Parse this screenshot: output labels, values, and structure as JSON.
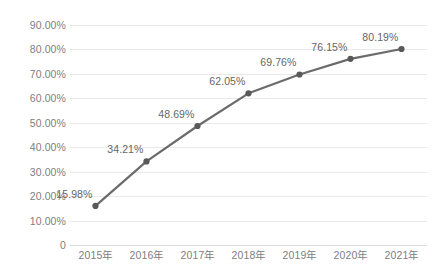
{
  "chart_data": {
    "type": "line",
    "title": "",
    "xlabel": "",
    "ylabel": "",
    "categories": [
      "2015年",
      "2016年",
      "2017年",
      "2018年",
      "2019年",
      "2020年",
      "2021年"
    ],
    "values": [
      15.98,
      34.21,
      48.69,
      62.05,
      69.76,
      76.15,
      80.19
    ],
    "point_labels": [
      "15.98%",
      "34.21%",
      "48.69%",
      "62.05%",
      "69.76%",
      "76.15%",
      "80.19%"
    ],
    "ylim": [
      0,
      90
    ],
    "y_tick_values": [
      90,
      80,
      70,
      60,
      50,
      40,
      30,
      20,
      10,
      0
    ],
    "y_tick_labels": [
      "90.00%",
      "80.00%",
      "70.00%",
      "60.00%",
      "50.00%",
      "40.00%",
      "30.00%",
      "20.00%",
      "10.00%",
      "0"
    ],
    "grid": true,
    "legend": "none",
    "series": [
      {
        "name": "",
        "values": [
          15.98,
          34.21,
          48.69,
          62.05,
          69.76,
          76.15,
          80.19
        ],
        "line_color": "#6b6b6b",
        "marker_color": "#595959",
        "marker": "circle"
      }
    ],
    "colors": {
      "background": "#ffffff",
      "gridline": "#e9e9e9",
      "baseline": "#dcdcdc",
      "tick_text": "#808080",
      "label_text": "#666666",
      "line": "#6b6b6b",
      "marker": "#595959"
    }
  }
}
